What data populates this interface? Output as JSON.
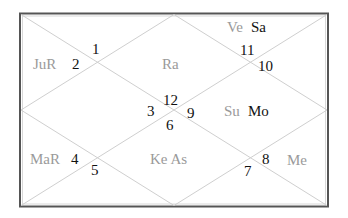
{
  "chart_title": "North Indian Kundali Chart",
  "colors": {
    "frame": "#555555",
    "lines": "#cfcfcf",
    "number": "#111111",
    "planet_gray": "#9a9a9a",
    "planet_dark": "#111111"
  },
  "houses": [
    {
      "house": 1,
      "sign": "12",
      "planets": []
    },
    {
      "house": 2,
      "sign": "11",
      "planets": [
        {
          "name": "Ve",
          "tone": "gray"
        },
        {
          "name": "Sa",
          "tone": "dark"
        }
      ]
    },
    {
      "house": 3,
      "sign": "10",
      "planets": []
    },
    {
      "house": 4,
      "sign": "9",
      "planets": [
        {
          "name": "Su",
          "tone": "gray"
        },
        {
          "name": "Mo",
          "tone": "dark"
        }
      ]
    },
    {
      "house": 5,
      "sign": "8",
      "planets": [
        {
          "name": "Me",
          "tone": "gray"
        }
      ]
    },
    {
      "house": 6,
      "sign": "7",
      "planets": []
    },
    {
      "house": 7,
      "sign": "6",
      "planets": [
        {
          "name": "Ke",
          "tone": "gray"
        },
        {
          "name": "As",
          "tone": "gray"
        }
      ]
    },
    {
      "house": 8,
      "sign": "5",
      "planets": []
    },
    {
      "house": 9,
      "sign": "4",
      "planets": [
        {
          "name": "MaR",
          "tone": "gray"
        }
      ]
    },
    {
      "house": 10,
      "sign": "3",
      "planets": []
    },
    {
      "house": 11,
      "sign": "2",
      "planets": [
        {
          "name": "JuR",
          "tone": "gray"
        }
      ]
    },
    {
      "house": 12,
      "sign": "1",
      "planets": []
    }
  ],
  "labels": {
    "n1": "1",
    "n2": "2",
    "n3": "3",
    "n4": "4",
    "n5": "5",
    "n6": "6",
    "n7": "7",
    "n8": "8",
    "n9": "9",
    "n10": "10",
    "n11": "11",
    "n12": "12",
    "p_jur": "JuR",
    "p_ra": "Ra",
    "p_ve": "Ve",
    "p_sa": "Sa",
    "p_su": "Su",
    "p_mo": "Mo",
    "p_mar": "MaR",
    "p_ke_as": "Ke As",
    "p_me": "Me"
  }
}
